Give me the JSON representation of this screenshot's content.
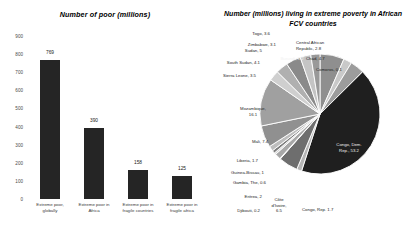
{
  "chart_data": [
    {
      "type": "bar",
      "title": "Number of poor (millions)",
      "xlabel": "",
      "ylabel": "",
      "ylim": [
        0,
        900
      ],
      "yticks": [
        0,
        100,
        200,
        300,
        400,
        500,
        600,
        700,
        800,
        900
      ],
      "grid": false,
      "legend": "none",
      "bar_color": "#252525",
      "categories": [
        "Extreme poor, globally",
        "Extreme poor in Africa",
        "Extreme poor in fragile countries",
        "Extreme poor in fragile Africa"
      ],
      "values": [
        769,
        390,
        158,
        125
      ]
    },
    {
      "type": "pie",
      "title": "Number (millions) living in extreme poverty in African FCV countries",
      "legend": "none",
      "labels": [
        "Burundi",
        "Central African Republic",
        "Chad",
        "Comoros",
        "Congo, Dem. Rep.",
        "Congo, Rep.",
        "Côte d'Ivoire",
        "Djibouti",
        "Eritrea",
        "Gambia, The",
        "Guinea-Bissau",
        "Liberia",
        "Mali",
        "Mozambique",
        "Sierra Leone",
        "South Sudan",
        "Sudan",
        "Togo",
        "Zimbabwe"
      ],
      "values": [
        8.2,
        2.8,
        4.7,
        0.1,
        53.2,
        1.7,
        6.5,
        0.2,
        2,
        0.6,
        1,
        1.7,
        7.4,
        16.1,
        3.5,
        4.1,
        5,
        3.6,
        3.1
      ]
    }
  ],
  "bar_chart": {
    "title": "Number of poor (millions)",
    "yticks": [
      "900",
      "800",
      "700",
      "600",
      "500",
      "400",
      "300",
      "200",
      "100",
      "0"
    ],
    "bars": [
      {
        "value_label": "769",
        "cat_line1": "Extreme poor,",
        "cat_line2": "globally"
      },
      {
        "value_label": "390",
        "cat_line1": "Extreme poor in",
        "cat_line2": "Africa"
      },
      {
        "value_label": "158",
        "cat_line1": "Extreme poor in",
        "cat_line2": "fragile countries"
      },
      {
        "value_label": "125",
        "cat_line1": "Extreme poor in",
        "cat_line2": "fragile africa"
      }
    ]
  },
  "pie_chart": {
    "title_line1": "Number (millions) living in extreme poverty in African",
    "title_line2": "FCV countries",
    "labels": {
      "zimbabwe": "Zimbabwe, 3.1",
      "central_african_republic": "Central African\nRepublic, 2.8",
      "chad": "Chad, 4.7",
      "comoros": "Comoros, 0.1",
      "congo_dem_rep": "Congo, Dem.\nRep., 53.2",
      "congo_rep": "Congo, Rep. 1.7",
      "cote_divoire": "Côte\nd'Ivoire,\n6.5",
      "djibouti": "Djibouti, 0.2",
      "eritrea": "Eritrea, 2",
      "gambia": "Gambia, The, 0.6",
      "guinea_bissau": "Guinea-Bissau, 1",
      "liberia": "Liberia, 1.7",
      "mali": "Mali, 7.4",
      "mozambique": "Mozambique,\n16.1",
      "sierra_leone": "Sierra Leone, 3.5",
      "south_sudan": "South Sudan, 4.1",
      "sudan": "Sudan, 5",
      "togo": "Togo, 3.6",
      "burundi": "Burundi, 8.2"
    }
  }
}
